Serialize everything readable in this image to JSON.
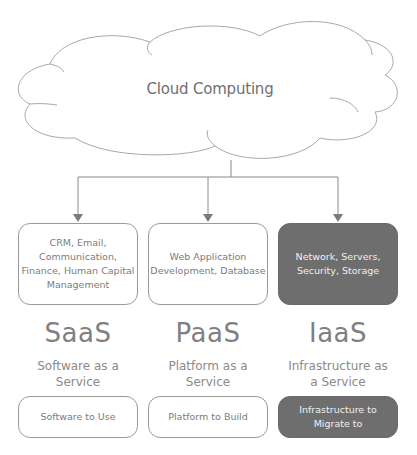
{
  "cloud": {
    "label": "Cloud Computing"
  },
  "columns": [
    {
      "abbr": "SaaS",
      "description": "Software as a Service",
      "description_lines": [
        "Software as a",
        "Service"
      ],
      "features": "CRM, Email, Communication, Finance, Human Capital Management",
      "features_lines": [
        "CRM, Email,",
        "Communication,",
        "Finance, Human Capital",
        "Management"
      ],
      "purpose": "Software to Use",
      "highlighted": false
    },
    {
      "abbr": "PaaS",
      "description": "Platform as a Service",
      "description_lines": [
        "Platform as a",
        "Service"
      ],
      "features": "Web Application Development, Database",
      "features_lines": [
        "Web Application",
        "Development, Database"
      ],
      "purpose": "Platform to Build",
      "highlighted": false
    },
    {
      "abbr": "IaaS",
      "description": "Infrastructure as a Service",
      "description_lines": [
        "Infrastructure as",
        "a Service"
      ],
      "features": "Network, Servers, Security, Storage",
      "features_lines": [
        "Network, Servers,",
        "Security, Storage"
      ],
      "purpose": "Infrastructure to Migrate to",
      "purpose_lines": [
        "Infrastructure to",
        "Migrate to"
      ],
      "highlighted": true
    }
  ],
  "colors": {
    "outline": "#9a9a9a",
    "highlight_fill": "#6e6e6e",
    "text": "#7c7c7c",
    "highlight_text": "#f0f0f0"
  }
}
